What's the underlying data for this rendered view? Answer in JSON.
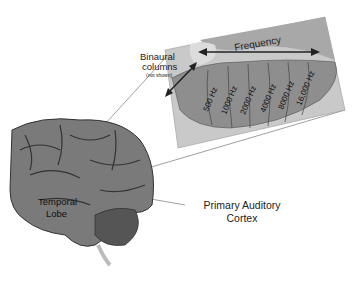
{
  "labels": {
    "frequency": "Frequency",
    "binaural_line1": "Binaural",
    "binaural_line2": "columns",
    "binaural_note": "(not shown)",
    "temporal_line1": "Temporal",
    "temporal_line2": "Lobe",
    "pac_line1": "Primary Auditory",
    "pac_line2": "Cortex"
  },
  "frequency_bands": [
    "500 Hz",
    "1000 Hz",
    "2000 Hz",
    "4000 Hz",
    "8000 Hz",
    "16,000 Hz"
  ],
  "colors": {
    "panel_bg": "#c9c9c9",
    "tonotopic_region": "#8e8e8e",
    "upper_region": "#a8a8a8",
    "light_region": "#dcdcdc",
    "brain": "#7a7a7a",
    "text": "#222222"
  }
}
